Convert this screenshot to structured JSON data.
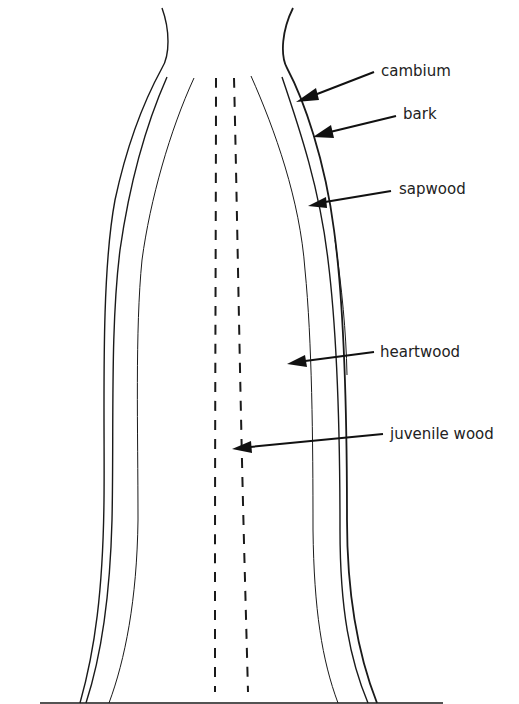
{
  "diagram": {
    "labels": {
      "cambium": "cambium",
      "bark": "bark",
      "sapwood": "sapwood",
      "heartwood": "heartwood",
      "juvenile_wood": "juvenile wood"
    },
    "colors": {
      "stroke": "#1a1a1a",
      "background": "#ffffff",
      "text": "#222222"
    }
  }
}
